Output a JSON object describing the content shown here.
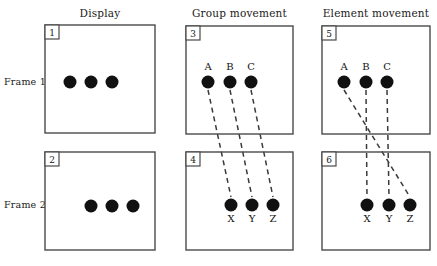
{
  "figure": {
    "width": 437,
    "height": 266,
    "background": "#ffffff",
    "stroke_color": "#4a4a4a",
    "dot_color": "#111111",
    "dash_color": "#3a3a3a"
  },
  "column_titles": [
    {
      "id": "display",
      "label": "Display"
    },
    {
      "id": "group-movement",
      "label": "Group movement"
    },
    {
      "id": "element-movement",
      "label": "Element movement"
    }
  ],
  "row_labels": [
    {
      "id": "frame-1",
      "label": "Frame 1"
    },
    {
      "id": "frame-2",
      "label": "Frame 2"
    }
  ],
  "panels": [
    {
      "id": "panel-1",
      "number": "1",
      "column": "display",
      "row": "frame-1",
      "x": 45,
      "y": 25,
      "w": 110,
      "h": 108,
      "dots": [
        {
          "id": "dot-1a",
          "label": "",
          "cx": 70,
          "cy": 82,
          "r": 6.5
        },
        {
          "id": "dot-1b",
          "label": "",
          "cx": 91,
          "cy": 82,
          "r": 6.5
        },
        {
          "id": "dot-1c",
          "label": "",
          "cx": 112,
          "cy": 82,
          "r": 6.5
        }
      ]
    },
    {
      "id": "panel-2",
      "number": "2",
      "column": "display",
      "row": "frame-2",
      "x": 45,
      "y": 152,
      "w": 110,
      "h": 98,
      "dots": [
        {
          "id": "dot-2a",
          "label": "",
          "cx": 91,
          "cy": 206,
          "r": 6.5
        },
        {
          "id": "dot-2b",
          "label": "",
          "cx": 112,
          "cy": 206,
          "r": 6.5
        },
        {
          "id": "dot-2c",
          "label": "",
          "cx": 133,
          "cy": 206,
          "r": 6.5
        }
      ]
    },
    {
      "id": "panel-3",
      "number": "3",
      "column": "group-movement",
      "row": "frame-1",
      "x": 186,
      "y": 26,
      "w": 107,
      "h": 108,
      "dots": [
        {
          "id": "dot-A3",
          "label": "A",
          "cx": 208,
          "cy": 82,
          "r": 6.5
        },
        {
          "id": "dot-B3",
          "label": "B",
          "cx": 230,
          "cy": 82,
          "r": 6.5
        },
        {
          "id": "dot-C3",
          "label": "C",
          "cx": 251,
          "cy": 82,
          "r": 6.5
        }
      ]
    },
    {
      "id": "panel-4",
      "number": "4",
      "column": "group-movement",
      "row": "frame-2",
      "x": 186,
      "y": 152,
      "w": 107,
      "h": 98,
      "dots": [
        {
          "id": "dot-X4",
          "label": "X",
          "cx": 231,
          "cy": 205,
          "r": 6.5
        },
        {
          "id": "dot-Y4",
          "label": "Y",
          "cx": 252,
          "cy": 205,
          "r": 6.5
        },
        {
          "id": "dot-Z4",
          "label": "Z",
          "cx": 273,
          "cy": 205,
          "r": 6.5
        }
      ]
    },
    {
      "id": "panel-5",
      "number": "5",
      "column": "element-movement",
      "row": "frame-1",
      "x": 322,
      "y": 26,
      "w": 108,
      "h": 108,
      "dots": [
        {
          "id": "dot-A5",
          "label": "A",
          "cx": 344,
          "cy": 82,
          "r": 6.5
        },
        {
          "id": "dot-B5",
          "label": "B",
          "cx": 366,
          "cy": 82,
          "r": 6.5
        },
        {
          "id": "dot-C5",
          "label": "C",
          "cx": 387,
          "cy": 82,
          "r": 6.5
        }
      ]
    },
    {
      "id": "panel-6",
      "number": "6",
      "column": "element-movement",
      "row": "frame-2",
      "x": 322,
      "y": 152,
      "w": 108,
      "h": 98,
      "dots": [
        {
          "id": "dot-X6",
          "label": "X",
          "cx": 367,
          "cy": 205,
          "r": 6.5
        },
        {
          "id": "dot-Y6",
          "label": "Y",
          "cx": 389,
          "cy": 205,
          "r": 6.5
        },
        {
          "id": "dot-Z6",
          "label": "Z",
          "cx": 410,
          "cy": 205,
          "r": 6.5
        }
      ]
    }
  ],
  "correspondence_lines": [
    {
      "id": "group-A-to-X",
      "from": "A",
      "to": "X",
      "x1": 208,
      "y1": 90,
      "x2": 231,
      "y2": 197
    },
    {
      "id": "group-B-to-Y",
      "from": "B",
      "to": "Y",
      "x1": 230,
      "y1": 90,
      "x2": 252,
      "y2": 197
    },
    {
      "id": "group-C-to-Z",
      "from": "C",
      "to": "Z",
      "x1": 251,
      "y1": 90,
      "x2": 273,
      "y2": 197
    },
    {
      "id": "element-A-to-Z",
      "from": "A",
      "to": "Z",
      "x1": 344,
      "y1": 90,
      "x2": 410,
      "y2": 197
    },
    {
      "id": "element-B-to-X",
      "from": "B",
      "to": "X",
      "x1": 366,
      "y1": 90,
      "x2": 367,
      "y2": 197
    },
    {
      "id": "element-C-to-Y",
      "from": "C",
      "to": "Y",
      "x1": 387,
      "y1": 90,
      "x2": 389,
      "y2": 197
    }
  ]
}
